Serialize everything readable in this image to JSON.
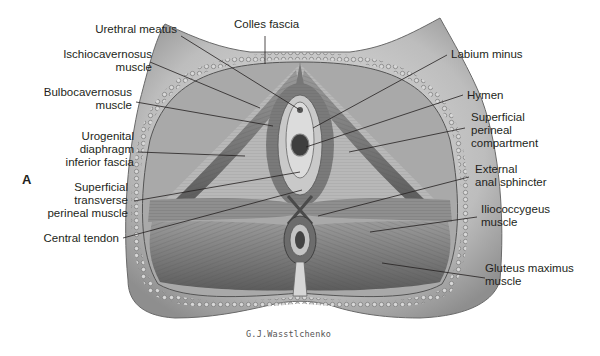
{
  "figure": {
    "panel_letter": "A",
    "signature": "G.J.Wasstlchenko",
    "colors": {
      "background": "#ffffff",
      "skin": "#cfcfcf",
      "muscle": "#8a8a8a",
      "dark": "#3a3a3a",
      "label_text": "#231f20"
    }
  },
  "labels": {
    "left": [
      {
        "id": "urethral-meatus",
        "lines": [
          "Urethral meatus"
        ]
      },
      {
        "id": "ischiocavernosus",
        "lines": [
          "Ischiocavernosus",
          "muscle"
        ]
      },
      {
        "id": "bulbocavernosus",
        "lines": [
          "Bulbocavernosus",
          "muscle"
        ]
      },
      {
        "id": "urogenital-diaphragm",
        "lines": [
          "Urogenital",
          "diaphragm",
          "inferior fascia"
        ]
      },
      {
        "id": "superficial-transverse",
        "lines": [
          "Superficial",
          "transverse",
          "perineal muscle"
        ]
      },
      {
        "id": "central-tendon",
        "lines": [
          "Central tendon"
        ]
      }
    ],
    "top": [
      {
        "id": "colles-fascia",
        "lines": [
          "Colles fascia"
        ]
      }
    ],
    "right": [
      {
        "id": "labium-minus",
        "lines": [
          "Labium minus"
        ]
      },
      {
        "id": "hymen",
        "lines": [
          "Hymen"
        ]
      },
      {
        "id": "superficial-perineal-compartment",
        "lines": [
          "Superficial",
          "perineal",
          "compartment"
        ]
      },
      {
        "id": "external-anal-sphincter",
        "lines": [
          "External",
          "anal sphincter"
        ]
      },
      {
        "id": "iliococcygeus",
        "lines": [
          "Iliococcygeus",
          "muscle"
        ]
      },
      {
        "id": "gluteus-maximus",
        "lines": [
          "Gluteus maximus",
          "muscle"
        ]
      }
    ]
  }
}
